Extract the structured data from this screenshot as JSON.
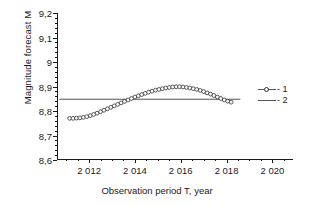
{
  "chart_data": {
    "type": "line",
    "title": "",
    "xlabel": "Observation period T, year",
    "ylabel": "Magnitude forecast  M",
    "xlim": [
      2010.6,
      2020.9
    ],
    "ylim": [
      8.6,
      9.2
    ],
    "grid": false,
    "decimal_separator": ",",
    "xticks": [
      2012,
      2014,
      2016,
      2018,
      2020
    ],
    "xtick_labels": [
      "2 012",
      "2 014",
      "2 016",
      "2 018",
      "2 020"
    ],
    "xminor_step": 0.5,
    "yticks": [
      8.6,
      8.7,
      8.8,
      8.9,
      9.0,
      9.1,
      9.2
    ],
    "ytick_labels": [
      "8,6",
      "8,7",
      "8,8",
      "8,9",
      "9",
      "9,1",
      "9,2"
    ],
    "yminor_step": 0.02,
    "legend": {
      "position": "right",
      "entries": [
        {
          "key": "marker-line",
          "label": "- 1"
        },
        {
          "key": "line",
          "label": "- 2"
        }
      ]
    },
    "series": [
      {
        "name": "1",
        "style": "line-with-open-circle-markers",
        "color": "#333333",
        "x": [
          2011.15,
          2011.3,
          2011.45,
          2011.6,
          2011.75,
          2011.9,
          2012.05,
          2012.2,
          2012.35,
          2012.5,
          2012.65,
          2012.8,
          2012.95,
          2013.1,
          2013.25,
          2013.4,
          2013.55,
          2013.7,
          2013.85,
          2014.0,
          2014.15,
          2014.3,
          2014.45,
          2014.6,
          2014.75,
          2014.9,
          2015.05,
          2015.2,
          2015.35,
          2015.5,
          2015.65,
          2015.8,
          2015.95,
          2016.1,
          2016.25,
          2016.4,
          2016.55,
          2016.7,
          2016.85,
          2017.0,
          2017.15,
          2017.3,
          2017.45,
          2017.6,
          2017.75,
          2017.9,
          2018.05,
          2018.2
        ],
        "y": [
          8.77,
          8.77,
          8.771,
          8.772,
          8.774,
          8.777,
          8.781,
          8.786,
          8.791,
          8.797,
          8.803,
          8.809,
          8.815,
          8.821,
          8.827,
          8.833,
          8.839,
          8.845,
          8.851,
          8.857,
          8.862,
          8.867,
          8.872,
          8.877,
          8.881,
          8.885,
          8.888,
          8.891,
          8.894,
          8.896,
          8.898,
          8.899,
          8.899,
          8.898,
          8.896,
          8.894,
          8.891,
          8.888,
          8.884,
          8.879,
          8.874,
          8.869,
          8.863,
          8.857,
          8.851,
          8.845,
          8.84,
          8.836
        ]
      },
      {
        "name": "2",
        "style": "horizontal-line",
        "color": "#555555",
        "constant_value": 8.848,
        "x": [
          2010.7,
          2018.6
        ],
        "y": [
          8.848,
          8.848
        ]
      }
    ]
  }
}
